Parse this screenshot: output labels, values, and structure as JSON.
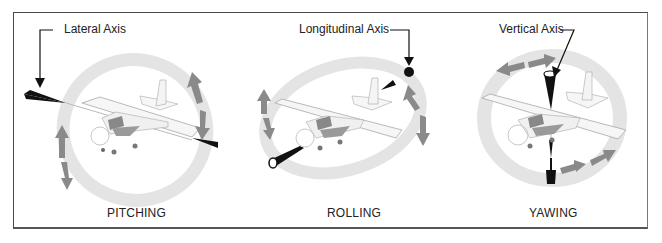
{
  "figure": {
    "panels": [
      {
        "id": "pitching",
        "axis_label": "Lateral Axis",
        "caption": "PITCHING"
      },
      {
        "id": "rolling",
        "axis_label": "Longitudinal Axis",
        "caption": "ROLLING"
      },
      {
        "id": "yawing",
        "axis_label": "Vertical Axis",
        "caption": "YAWING"
      }
    ]
  },
  "colors": {
    "frame": "#4a4a4a",
    "ring": "#e6e6e6",
    "ring_edge": "#d2d2d2",
    "motion_arrow": "#8a8a8a",
    "axis_spindle": "#111111",
    "airplane_body": "#f4f4f4",
    "airplane_outline": "#9a9a9a",
    "text": "#222222"
  }
}
